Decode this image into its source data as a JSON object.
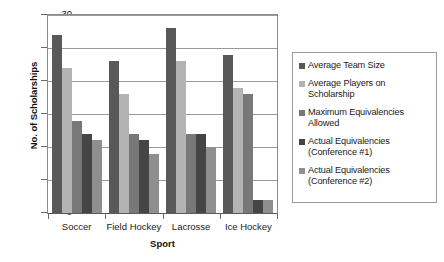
{
  "chart_data": {
    "type": "bar",
    "title": "",
    "xlabel": "Sport",
    "ylabel": "No. of Scholarships",
    "ylim": [
      0,
      30
    ],
    "ytick_step": 5,
    "yticks": [
      30,
      25,
      20,
      15,
      10,
      5,
      0
    ],
    "grid": true,
    "legend_position": "right",
    "categories": [
      "Soccer",
      "Field Hockey",
      "Lacrosse",
      "Ice Hockey"
    ],
    "series": [
      {
        "name": "Average Team Size",
        "color": "#595959",
        "values": [
          27,
          23,
          28,
          24
        ]
      },
      {
        "name": "Average Players on Scholarship",
        "color": "#b3b3b3",
        "values": [
          22,
          18,
          23,
          19
        ]
      },
      {
        "name": "Maximum Equivalencies Allowed",
        "color": "#787878",
        "values": [
          14,
          12,
          12,
          18
        ]
      },
      {
        "name": "Actual Equivalencies (Conference #1)",
        "color": "#454545",
        "values": [
          12,
          11,
          12,
          2
        ]
      },
      {
        "name": "Actual Equivalencies (Conference #2)",
        "color": "#8f8f8f",
        "values": [
          11,
          9,
          10,
          2
        ]
      }
    ]
  },
  "legend": {
    "items": [
      {
        "line1": "Average Team Size",
        "line2": ""
      },
      {
        "line1": "Average Players on",
        "line2": "Scholarship"
      },
      {
        "line1": "Maximum Equivalencies",
        "line2": "Allowed"
      },
      {
        "line1": "Actual Equivalencies",
        "line2": "(Conference #1)"
      },
      {
        "line1": "Actual Equivalencies",
        "line2": "(Conference #2)"
      }
    ]
  },
  "axes": {
    "y_title": "No. of Scholarships",
    "x_title": "Sport"
  }
}
